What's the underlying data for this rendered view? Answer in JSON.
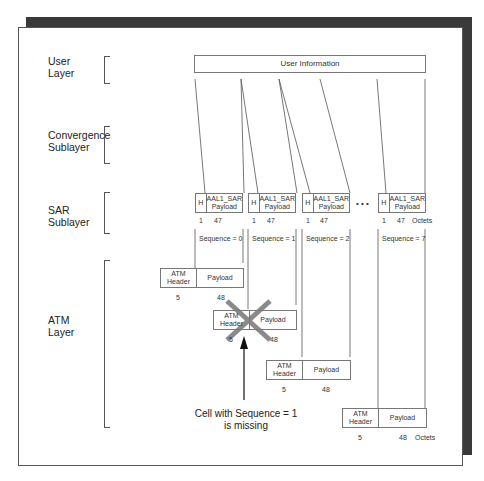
{
  "layers": {
    "user": "User\nLayer",
    "convergence": "Convergence\nSublayer",
    "sar": "SAR\nSublayer",
    "atm": "ATM\nLayer"
  },
  "user_info": "User Information",
  "sar_cells": [
    {
      "h": "H",
      "payload": "AAL1_SAR Payload",
      "size_h": "1",
      "size_p": "47",
      "sequence": "Sequence = 0"
    },
    {
      "h": "H",
      "payload": "AAL1_SAR Payload",
      "size_h": "1",
      "size_p": "47",
      "sequence": "Sequence = 1"
    },
    {
      "h": "H",
      "payload": "AAL1_SAR Payload",
      "size_h": "1",
      "size_p": "47",
      "sequence": "Sequence = 2"
    },
    {
      "h": "H",
      "payload": "AAL1_SAR Payload",
      "size_h": "1",
      "size_p": "47",
      "sequence": "Sequence = 7"
    }
  ],
  "ellipsis": "• • •",
  "octets_label": "Octets",
  "atm_cells": [
    {
      "header": "ATM Header",
      "payload": "Payload",
      "size_h": "5",
      "size_p": "48",
      "missing": false
    },
    {
      "header": "ATM Header",
      "payload": "Payload",
      "size_h": "5",
      "size_p": "48",
      "missing": true
    },
    {
      "header": "ATM Header",
      "payload": "Payload",
      "size_h": "5",
      "size_p": "48",
      "missing": false
    },
    {
      "header": "ATM Header",
      "payload": "Payload",
      "size_h": "5",
      "size_p": "48",
      "missing": false
    }
  ],
  "annotation": "Cell with Sequence = 1\nis missing",
  "colors": {
    "cross": "#8a8a8a",
    "shadow": "#3a3a3a"
  }
}
